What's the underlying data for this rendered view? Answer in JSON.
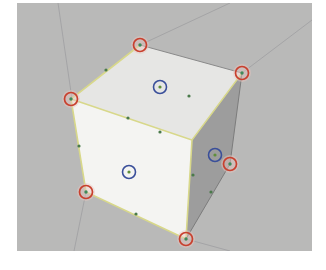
{
  "viewport": {
    "background": "#b9b9b8",
    "bounds": {
      "x": 17,
      "y": 3,
      "width": 295,
      "height": 248
    }
  },
  "cube": {
    "faces": {
      "top": {
        "color": "#e6e6e4"
      },
      "front": {
        "color": "#f4f4f2"
      },
      "right": {
        "color": "#9d9d9d"
      }
    },
    "edge_highlight_color": "#d8d88a",
    "vertices": [
      {
        "name": "top-back",
        "x": 140,
        "y": 45
      },
      {
        "name": "top-right",
        "x": 242,
        "y": 73
      },
      {
        "name": "top-left",
        "x": 71,
        "y": 99
      },
      {
        "name": "top-front",
        "x": 192,
        "y": 140
      },
      {
        "name": "bottom-left",
        "x": 86,
        "y": 192
      },
      {
        "name": "bottom-front",
        "x": 186,
        "y": 239
      },
      {
        "name": "right-middle",
        "x": 230,
        "y": 164
      }
    ],
    "vertex_markers": {
      "color": "#c8402e",
      "points": [
        [
          140,
          45
        ],
        [
          242,
          73
        ],
        [
          71,
          99
        ],
        [
          86,
          192
        ],
        [
          186,
          239
        ],
        [
          230,
          164
        ]
      ]
    },
    "face_center_markers": {
      "color": "#3a4f9a",
      "points": [
        [
          160,
          87
        ],
        [
          129,
          172
        ],
        [
          215,
          155
        ]
      ]
    },
    "midpoint_dots": {
      "color": "#4a7a4a",
      "points": [
        [
          106,
          70
        ],
        [
          128,
          118
        ],
        [
          79,
          146
        ],
        [
          136,
          214
        ],
        [
          211,
          192
        ],
        [
          160,
          132
        ],
        [
          189,
          96
        ],
        [
          193,
          175
        ]
      ]
    }
  },
  "ground_grid": {
    "color": "#a4a4a6",
    "lines": [
      [
        [
          58,
          3
        ],
        [
          72,
          99
        ]
      ],
      [
        [
          86,
          192
        ],
        [
          74,
          251
        ]
      ],
      [
        [
          186,
          239
        ],
        [
          230,
          251
        ]
      ],
      [
        [
          242,
          73
        ],
        [
          312,
          20
        ]
      ],
      [
        [
          140,
          45
        ],
        [
          230,
          3
        ]
      ]
    ]
  }
}
